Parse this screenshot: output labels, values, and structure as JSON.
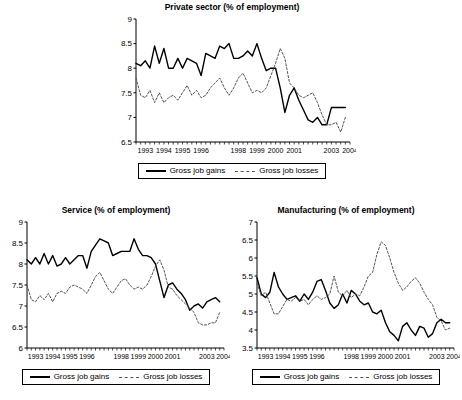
{
  "figure": {
    "legend": {
      "gains_label": "Gross job gains",
      "losses_label": "Gross job losses",
      "gains_style": "solid",
      "losses_style": "dashed",
      "gains_color": "#000000",
      "losses_color": "#555555"
    }
  },
  "chart_data": [
    {
      "id": "private",
      "type": "line",
      "title": "Private sector (% of employment)",
      "xlabel": "",
      "ylabel": "",
      "ylim": [
        6.5,
        9
      ],
      "yticks": [
        6.5,
        7,
        7.5,
        8,
        8.5,
        9
      ],
      "ytick_labels": [
        "6.5",
        "7",
        "7.5",
        "8",
        "8.5",
        "9"
      ],
      "xlim": [
        1993.0,
        2004.5
      ],
      "xticks": [
        1993,
        1994,
        1995,
        1996,
        1998,
        1999,
        2000,
        2001,
        2003,
        2004
      ],
      "xtick_labels": [
        "1993",
        "1994",
        "1995",
        "1996",
        "1998",
        "1999",
        "2000",
        "2001",
        "2003",
        "2004"
      ],
      "minor_ticks_per_year": 4,
      "grid": false,
      "legend_position": "below",
      "x": [
        1993.0,
        1993.25,
        1993.5,
        1993.75,
        1994.0,
        1994.25,
        1994.5,
        1994.75,
        1995.0,
        1995.25,
        1995.5,
        1995.75,
        1996.0,
        1996.25,
        1996.5,
        1996.75,
        1997.0,
        1997.25,
        1997.5,
        1997.75,
        1998.0,
        1998.25,
        1998.5,
        1998.75,
        1999.0,
        1999.25,
        1999.5,
        1999.75,
        2000.0,
        2000.25,
        2000.5,
        2000.75,
        2001.0,
        2001.25,
        2001.5,
        2001.75,
        2002.0,
        2002.25,
        2002.5,
        2002.75,
        2003.0,
        2003.25,
        2003.5,
        2003.75,
        2004.0,
        2004.25
      ],
      "series": [
        {
          "name": "Gross job gains",
          "style": "solid",
          "values": [
            8.1,
            8.05,
            8.15,
            8.0,
            8.45,
            8.1,
            8.4,
            8.0,
            8.0,
            8.2,
            8.0,
            8.2,
            8.15,
            8.1,
            7.85,
            8.3,
            8.25,
            8.2,
            8.45,
            8.4,
            8.5,
            8.2,
            8.2,
            8.25,
            8.35,
            8.25,
            8.5,
            8.2,
            7.95,
            8.0,
            8.0,
            7.6,
            7.1,
            7.45,
            7.6,
            7.35,
            7.15,
            6.95,
            6.9,
            7.0,
            6.85,
            6.85,
            7.2,
            7.2,
            7.2,
            7.2
          ]
        },
        {
          "name": "Gross job losses",
          "style": "dashed",
          "values": [
            7.8,
            7.45,
            7.4,
            7.55,
            7.3,
            7.5,
            7.3,
            7.4,
            7.45,
            7.35,
            7.5,
            7.65,
            7.45,
            7.55,
            7.4,
            7.45,
            7.6,
            7.7,
            7.8,
            7.6,
            7.45,
            7.6,
            7.8,
            7.9,
            7.7,
            7.5,
            7.55,
            7.5,
            7.6,
            7.85,
            8.1,
            8.4,
            8.2,
            7.7,
            7.6,
            7.45,
            7.4,
            7.45,
            7.5,
            7.3,
            7.05,
            6.85,
            6.85,
            6.9,
            6.7,
            7.0
          ]
        }
      ]
    },
    {
      "id": "service",
      "type": "line",
      "title": "Service (% of employment)",
      "xlabel": "",
      "ylabel": "",
      "ylim": [
        6,
        9
      ],
      "yticks": [
        6,
        6.5,
        7,
        7.5,
        8,
        8.5,
        9
      ],
      "ytick_labels": [
        "6",
        "6.5",
        "7",
        "7.5",
        "8",
        "8.5",
        "9"
      ],
      "xlim": [
        1993.0,
        2004.5
      ],
      "xticks": [
        1993,
        1994,
        1995,
        1996,
        1998,
        1999,
        2000,
        2001,
        2003,
        2004
      ],
      "xtick_labels": [
        "1993",
        "1994",
        "1995",
        "1996",
        "1998",
        "1999",
        "2000",
        "2001",
        "2003",
        "2004"
      ],
      "minor_ticks_per_year": 4,
      "grid": false,
      "legend_position": "below",
      "x": [
        1993.0,
        1993.25,
        1993.5,
        1993.75,
        1994.0,
        1994.25,
        1994.5,
        1994.75,
        1995.0,
        1995.25,
        1995.5,
        1995.75,
        1996.0,
        1996.25,
        1996.5,
        1996.75,
        1997.0,
        1997.25,
        1997.5,
        1997.75,
        1998.0,
        1998.25,
        1998.5,
        1998.75,
        1999.0,
        1999.25,
        1999.5,
        1999.75,
        2000.0,
        2000.25,
        2000.5,
        2000.75,
        2001.0,
        2001.25,
        2001.5,
        2001.75,
        2002.0,
        2002.25,
        2002.5,
        2002.75,
        2003.0,
        2003.25,
        2003.5,
        2003.75,
        2004.0,
        2004.25
      ],
      "series": [
        {
          "name": "Gross job gains",
          "style": "solid",
          "values": [
            8.1,
            8.0,
            8.15,
            8.0,
            8.25,
            8.0,
            8.2,
            7.95,
            8.0,
            8.15,
            8.0,
            8.1,
            8.2,
            8.2,
            7.9,
            8.3,
            8.45,
            8.6,
            8.55,
            8.5,
            8.2,
            8.25,
            8.3,
            8.3,
            8.3,
            8.6,
            8.35,
            8.2,
            8.2,
            8.15,
            8.0,
            7.6,
            7.2,
            7.5,
            7.55,
            7.4,
            7.3,
            7.15,
            6.9,
            7.0,
            7.05,
            6.95,
            7.1,
            7.15,
            7.2,
            7.1
          ]
        },
        {
          "name": "Gross job losses",
          "style": "dashed",
          "values": [
            7.5,
            7.15,
            7.1,
            7.25,
            7.15,
            7.3,
            7.1,
            7.3,
            7.35,
            7.3,
            7.45,
            7.5,
            7.45,
            7.4,
            7.3,
            7.5,
            7.7,
            7.8,
            7.6,
            7.4,
            7.3,
            7.45,
            7.6,
            7.65,
            7.5,
            7.4,
            7.45,
            7.4,
            7.5,
            7.7,
            7.95,
            8.1,
            7.85,
            7.45,
            7.4,
            7.25,
            7.15,
            7.05,
            6.95,
            6.85,
            6.6,
            6.55,
            6.55,
            6.6,
            6.6,
            6.85
          ]
        }
      ]
    },
    {
      "id": "manufacturing",
      "type": "line",
      "title": "Manufacturing (% of employment)",
      "xlabel": "",
      "ylabel": "",
      "ylim": [
        3.5,
        7
      ],
      "yticks": [
        3.5,
        4,
        4.5,
        5,
        5.5,
        6,
        6.5,
        7
      ],
      "ytick_labels": [
        "3.5",
        "4",
        "4.5",
        "5",
        "5.5",
        "6",
        "6.5",
        "7"
      ],
      "xlim": [
        1993.0,
        2004.5
      ],
      "xticks": [
        1993,
        1994,
        1995,
        1996,
        1998,
        1999,
        2000,
        2001,
        2003,
        2004
      ],
      "xtick_labels": [
        "1993",
        "1994",
        "1995",
        "1996",
        "1998",
        "1999",
        "2000",
        "2001",
        "2003",
        "2004"
      ],
      "minor_ticks_per_year": 4,
      "grid": false,
      "legend_position": "below",
      "x": [
        1993.0,
        1993.25,
        1993.5,
        1993.75,
        1994.0,
        1994.25,
        1994.5,
        1994.75,
        1995.0,
        1995.25,
        1995.5,
        1995.75,
        1996.0,
        1996.25,
        1996.5,
        1996.75,
        1997.0,
        1997.25,
        1997.5,
        1997.75,
        1998.0,
        1998.25,
        1998.5,
        1998.75,
        1999.0,
        1999.25,
        1999.5,
        1999.75,
        2000.0,
        2000.25,
        2000.5,
        2000.75,
        2001.0,
        2001.25,
        2001.5,
        2001.75,
        2002.0,
        2002.25,
        2002.5,
        2002.75,
        2003.0,
        2003.25,
        2003.5,
        2003.75,
        2004.0,
        2004.25
      ],
      "series": [
        {
          "name": "Gross job gains",
          "style": "solid",
          "values": [
            5.45,
            5.0,
            4.9,
            5.05,
            5.6,
            5.2,
            5.0,
            4.85,
            4.9,
            4.95,
            4.8,
            5.0,
            4.85,
            5.05,
            5.35,
            5.4,
            5.1,
            4.75,
            4.6,
            4.7,
            5.0,
            4.75,
            5.1,
            5.0,
            4.8,
            4.7,
            4.75,
            4.5,
            4.45,
            4.55,
            4.2,
            3.95,
            3.85,
            3.7,
            4.1,
            4.2,
            4.0,
            3.85,
            4.1,
            4.05,
            3.8,
            3.9,
            4.2,
            4.3,
            4.2,
            4.2
          ]
        },
        {
          "name": "Gross job losses",
          "style": "dashed",
          "values": [
            5.3,
            4.95,
            5.05,
            4.75,
            4.45,
            4.45,
            4.65,
            4.85,
            4.8,
            4.9,
            4.8,
            4.85,
            4.7,
            4.85,
            4.95,
            4.85,
            4.9,
            5.0,
            5.5,
            5.05,
            4.95,
            5.1,
            4.9,
            5.0,
            4.95,
            5.2,
            5.5,
            5.6,
            6.1,
            6.45,
            6.35,
            6.0,
            5.6,
            5.3,
            5.1,
            5.2,
            5.35,
            5.45,
            5.3,
            5.05,
            4.85,
            4.7,
            4.35,
            4.25,
            4.0,
            4.05
          ]
        }
      ]
    }
  ]
}
